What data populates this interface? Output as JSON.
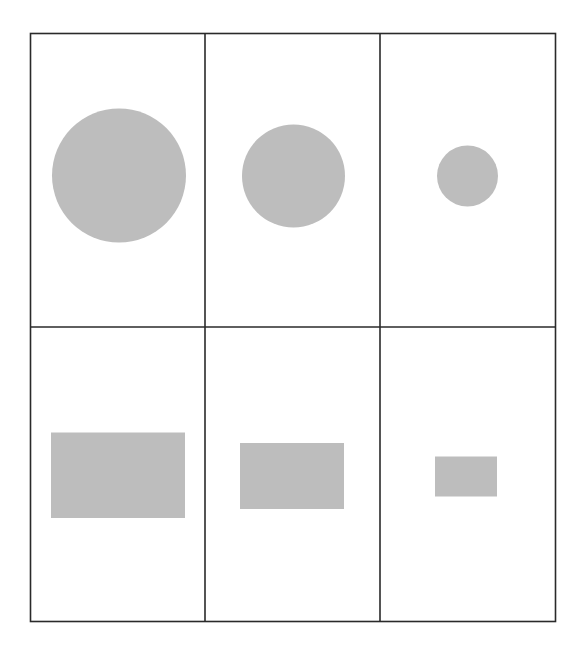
{
  "diagram": {
    "background": "#ffffff",
    "grid": {
      "rows": 2,
      "cols": 3,
      "x": 30.5,
      "y": 33.5,
      "width": 525,
      "height": 588,
      "col_dividers_x": [
        205,
        380
      ],
      "row_divider_y": 327,
      "stroke": "#2a2a2a",
      "stroke_width": 1.6
    },
    "shape_fill": "#bdbdbd",
    "cells": [
      {
        "row": 0,
        "col": 0,
        "shape": "circle",
        "size": "large",
        "cx": 119,
        "cy": 175.5,
        "r": 67
      },
      {
        "row": 0,
        "col": 1,
        "shape": "circle",
        "size": "medium",
        "cx": 293.5,
        "cy": 176,
        "r": 51.5
      },
      {
        "row": 0,
        "col": 2,
        "shape": "circle",
        "size": "small",
        "cx": 467.5,
        "cy": 176,
        "r": 30.5
      },
      {
        "row": 1,
        "col": 0,
        "shape": "rectangle",
        "size": "large",
        "x": 51,
        "y": 432.5,
        "w": 134,
        "h": 85.5
      },
      {
        "row": 1,
        "col": 1,
        "shape": "rectangle",
        "size": "medium",
        "x": 240,
        "y": 443,
        "w": 104,
        "h": 66
      },
      {
        "row": 1,
        "col": 2,
        "shape": "rectangle",
        "size": "small",
        "x": 435,
        "y": 456.5,
        "w": 62,
        "h": 40
      }
    ]
  }
}
